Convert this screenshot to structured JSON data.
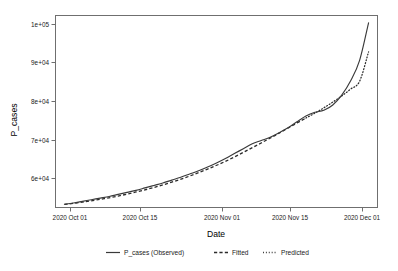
{
  "chart_data": {
    "type": "line",
    "title": "",
    "xlabel": "Date",
    "ylabel": "P_cases",
    "grid": false,
    "legend_position": "bottom",
    "xlim": [
      "2020-09-27",
      "2020-12-08"
    ],
    "ylim": [
      54500,
      101500
    ],
    "ytick_labels": [
      "1e+05",
      "9e+04",
      "8e+04",
      "7e+04",
      "6e+04"
    ],
    "ytick_values": [
      100000,
      90000,
      80000,
      70000,
      60000
    ],
    "xtick_labels": [
      "2020 Oct 01",
      "2020 Oct 15",
      "2020 Nov 01",
      "2020 Nov 15",
      "2020 Dec 01"
    ],
    "xtick_dates": [
      "2020-10-01",
      "2020-10-15",
      "2020-11-01",
      "2020-11-15",
      "2020-12-01"
    ],
    "series": [
      {
        "name": "P_cases (Observed)",
        "style": "solid",
        "color": "#3a3a3a",
        "x": [
          "2020-09-29",
          "2020-10-01",
          "2020-10-03",
          "2020-10-05",
          "2020-10-07",
          "2020-10-09",
          "2020-10-11",
          "2020-10-13",
          "2020-10-15",
          "2020-10-17",
          "2020-10-19",
          "2020-10-21",
          "2020-10-23",
          "2020-10-25",
          "2020-10-27",
          "2020-10-29",
          "2020-10-31",
          "2020-11-02",
          "2020-11-04",
          "2020-11-06",
          "2020-11-08",
          "2020-11-10",
          "2020-11-12",
          "2020-11-14",
          "2020-11-16",
          "2020-11-18",
          "2020-11-20",
          "2020-11-22",
          "2020-11-24",
          "2020-11-26",
          "2020-11-28",
          "2020-11-30",
          "2020-12-02",
          "2020-12-04",
          "2020-12-06"
        ],
        "y": [
          55300,
          55600,
          56000,
          56400,
          56800,
          57200,
          57700,
          58200,
          58700,
          59300,
          59900,
          60500,
          61200,
          61900,
          62700,
          63500,
          64400,
          65400,
          66500,
          67700,
          68900,
          70100,
          70900,
          71700,
          72800,
          74000,
          75500,
          76900,
          77800,
          78300,
          79600,
          82000,
          85500,
          90500,
          99700
        ]
      },
      {
        "name": "Fitted",
        "style": "dashed",
        "color": "#2b2b2b",
        "x": [
          "2020-09-29",
          "2020-10-03",
          "2020-10-07",
          "2020-10-11",
          "2020-10-15",
          "2020-10-19",
          "2020-10-23",
          "2020-10-27",
          "2020-10-31",
          "2020-11-04",
          "2020-11-08",
          "2020-11-12",
          "2020-11-16",
          "2020-11-20",
          "2020-11-22"
        ],
        "y": [
          55250,
          55800,
          56500,
          57300,
          58300,
          59400,
          60700,
          62200,
          63900,
          65800,
          68000,
          70300,
          72700,
          75200,
          76400
        ]
      },
      {
        "name": "Predicted",
        "style": "dotted",
        "color": "#2b2b2b",
        "x": [
          "2020-11-22",
          "2020-11-24",
          "2020-11-26",
          "2020-11-28",
          "2020-11-30",
          "2020-12-02",
          "2020-12-04",
          "2020-12-06"
        ],
        "y": [
          76400,
          77600,
          78900,
          80300,
          81800,
          83500,
          85400,
          92600
        ]
      }
    ]
  },
  "axes": {
    "y_title": "P_cases",
    "x_title": "Date"
  },
  "legend": {
    "items": [
      {
        "label": "P_cases (Observed)",
        "key": "solid-line-key"
      },
      {
        "label": "Fitted",
        "key": "dashed-line-key"
      },
      {
        "label": "Predicted",
        "key": "dotted-line-key"
      }
    ]
  }
}
